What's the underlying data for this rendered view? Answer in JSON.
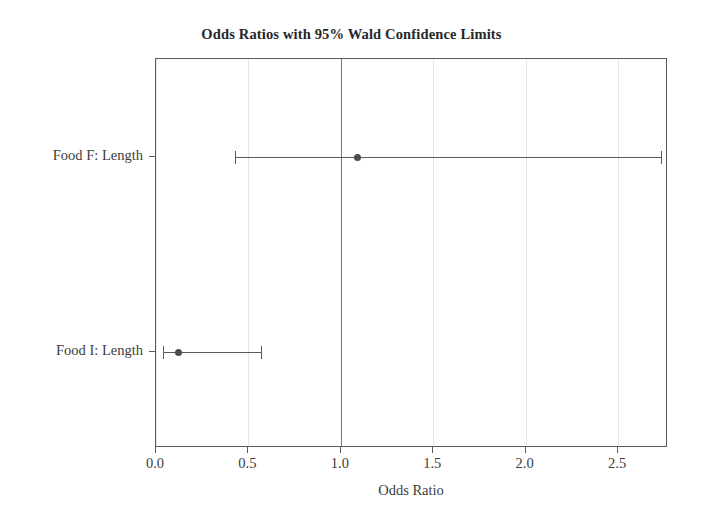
{
  "chart_data": {
    "type": "scatter",
    "title": "Odds Ratios with 95% Wald Confidence Limits",
    "xlabel": "Odds Ratio",
    "ylabel": "",
    "xlim": [
      0.0,
      2.77
    ],
    "ylim": [
      0,
      2
    ],
    "grid": true,
    "legend": null,
    "reference_line": 1.0,
    "xticks": [
      0.0,
      0.5,
      1.0,
      1.5,
      2.0,
      2.5
    ],
    "xtick_labels": [
      "0.0",
      "0.5",
      "1.0",
      "1.5",
      "2.0",
      "2.5"
    ],
    "categories": [
      "Food F: Length",
      "Food I: Length"
    ],
    "series": [
      {
        "name": "Odds Ratio Estimate",
        "values": [
          1.09,
          0.12
        ],
        "lower": [
          0.43,
          0.04
        ],
        "upper": [
          2.73,
          0.57
        ]
      }
    ],
    "points": [
      {
        "label": "Food F: Length",
        "estimate": 1.09,
        "lower_limit": 0.43,
        "upper_limit": 2.73
      },
      {
        "label": "Food I: Length",
        "estimate": 0.12,
        "lower_limit": 0.04,
        "upper_limit": 0.57
      }
    ],
    "colors": {
      "marker": "#4d4d4d",
      "error_bar": "#5a5a5a",
      "reference_line": "#777777",
      "gridline": "#e6e6e6",
      "frame": "#5b5b5b",
      "text": "#3c3c3c",
      "background": "#ffffff"
    }
  }
}
